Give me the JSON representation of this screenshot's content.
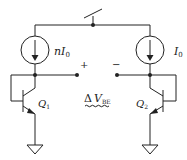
{
  "diagram": {
    "type": "circuit-schematic",
    "labels": {
      "left_current_source": {
        "main": "nI",
        "sub": "0"
      },
      "right_current_source": {
        "main": "I",
        "sub": "0"
      },
      "q1": {
        "main": "Q",
        "sub": "1"
      },
      "q2": {
        "main": "Q",
        "sub": "2"
      },
      "plus": "+",
      "minus": "−",
      "delta_vbe": {
        "delta": "Δ",
        "main": "V",
        "sub": "BE"
      }
    },
    "components": [
      "supply-switch",
      "current-source-nI0",
      "current-source-I0",
      "transistor-Q1",
      "transistor-Q2",
      "ground-left",
      "ground-right"
    ],
    "colors": {
      "stroke": "#222222",
      "background": "#ffffff"
    }
  }
}
